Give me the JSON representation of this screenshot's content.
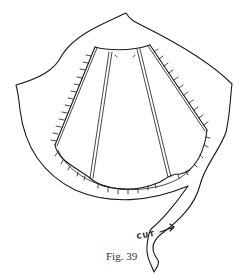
{
  "figure": {
    "caption": "Fig. 39",
    "cut_label": "CUT",
    "stroke_color": "#1a1a1a",
    "background": "#ffffff"
  }
}
